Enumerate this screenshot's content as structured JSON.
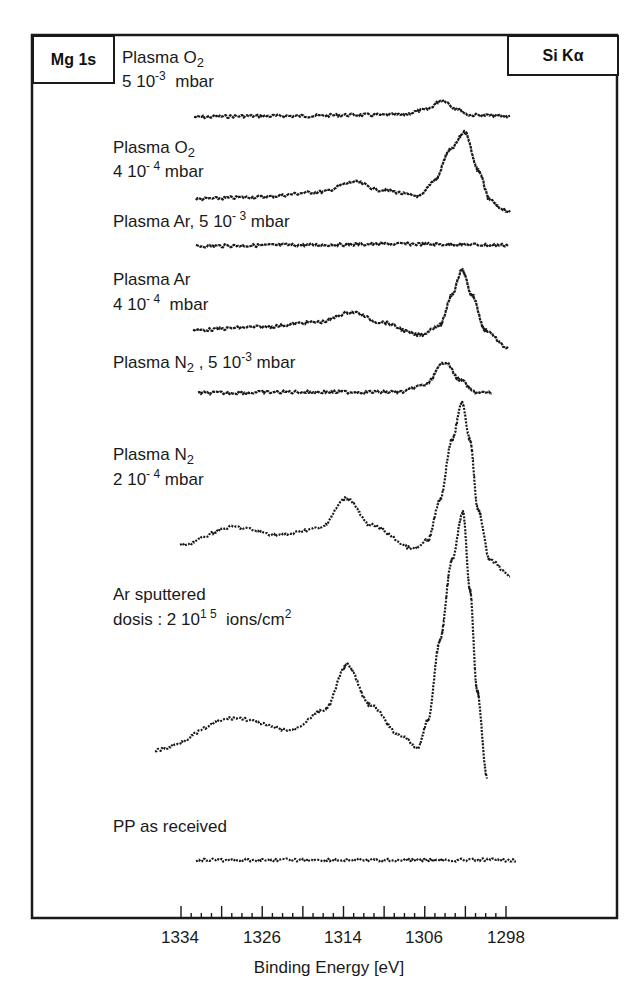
{
  "chart_data": {
    "type": "line",
    "title": "",
    "xlabel": "Binding Energy [eV]",
    "ylabel": "",
    "x_reversed": true,
    "xlim": [
      1334,
      1298
    ],
    "x_ticks": [
      "1334",
      "1326",
      "1314",
      "1306",
      "1298"
    ],
    "grid": false,
    "legend": "none (inline trace labels)",
    "corner_tags": {
      "left": "Mg 1s",
      "right": "Si Kα"
    },
    "series": [
      {
        "name": "Plasma O2, 5 10^-3 mbar",
        "label_lines": [
          "Plasma O",
          "2",
          "5 10",
          "-3",
          "mbar"
        ],
        "description": "nearly flat baseline with weak peak near 1303 eV",
        "points_px": [
          [
            194,
            117
          ],
          [
            250,
            116
          ],
          [
            300,
            116
          ],
          [
            350,
            115
          ],
          [
            400,
            115
          ],
          [
            425,
            110
          ],
          [
            443,
            100
          ],
          [
            455,
            108
          ],
          [
            470,
            115
          ],
          [
            510,
            116
          ]
        ]
      },
      {
        "name": "Plasma O2, 4 10^-4 mbar",
        "description": "small bump near 1314 eV, strong peak near 1302 eV",
        "points_px": [
          [
            196,
            199
          ],
          [
            260,
            197
          ],
          [
            320,
            192
          ],
          [
            355,
            182
          ],
          [
            380,
            190
          ],
          [
            420,
            196
          ],
          [
            435,
            180
          ],
          [
            450,
            150
          ],
          [
            465,
            132
          ],
          [
            478,
            170
          ],
          [
            490,
            200
          ],
          [
            500,
            208
          ],
          [
            510,
            212
          ]
        ]
      },
      {
        "name": "Plasma Ar, 5 10^-3 mbar",
        "description": "flat, no features",
        "points_px": [
          [
            196,
            246
          ],
          [
            300,
            245
          ],
          [
            400,
            244
          ],
          [
            508,
            245
          ]
        ]
      },
      {
        "name": "Plasma Ar, 4 10^-4 mbar",
        "description": "bump near 1314 eV, strong peak near 1302 eV",
        "points_px": [
          [
            193,
            330
          ],
          [
            260,
            327
          ],
          [
            320,
            322
          ],
          [
            352,
            312
          ],
          [
            380,
            322
          ],
          [
            420,
            335
          ],
          [
            440,
            325
          ],
          [
            452,
            295
          ],
          [
            462,
            270
          ],
          [
            472,
            295
          ],
          [
            485,
            330
          ],
          [
            508,
            348
          ]
        ]
      },
      {
        "name": "Plasma N2, 5 10^-3 mbar",
        "description": "flat with a peak near 1303 eV",
        "points_px": [
          [
            198,
            393
          ],
          [
            300,
            392
          ],
          [
            400,
            392
          ],
          [
            425,
            385
          ],
          [
            445,
            362
          ],
          [
            460,
            380
          ],
          [
            475,
            392
          ],
          [
            492,
            393
          ]
        ]
      },
      {
        "name": "Plasma N2, 2 10^-4 mbar",
        "description": "shoulder near 1329 eV, peak near 1314 eV, very strong peak near 1302 eV",
        "points_px": [
          [
            180,
            545
          ],
          [
            233,
            527
          ],
          [
            280,
            535
          ],
          [
            320,
            528
          ],
          [
            347,
            498
          ],
          [
            370,
            525
          ],
          [
            415,
            549
          ],
          [
            428,
            540
          ],
          [
            440,
            500
          ],
          [
            452,
            440
          ],
          [
            462,
            403
          ],
          [
            470,
            440
          ],
          [
            478,
            510
          ],
          [
            490,
            560
          ],
          [
            510,
            576
          ]
        ]
      },
      {
        "name": "Ar sputtered, dosis: 2 10^15 ions/cm2",
        "description": "rising background, peak near 1314 eV, dominant sharp peak near 1302 eV",
        "points_px": [
          [
            155,
            750
          ],
          [
            235,
            718
          ],
          [
            290,
            730
          ],
          [
            325,
            710
          ],
          [
            347,
            665
          ],
          [
            370,
            705
          ],
          [
            400,
            735
          ],
          [
            418,
            748
          ],
          [
            428,
            720
          ],
          [
            440,
            640
          ],
          [
            452,
            560
          ],
          [
            463,
            512
          ],
          [
            470,
            590
          ],
          [
            477,
            690
          ],
          [
            487,
            777
          ]
        ]
      },
      {
        "name": "PP as received",
        "description": "flat, no features",
        "points_px": [
          [
            196,
            860
          ],
          [
            300,
            860
          ],
          [
            400,
            860
          ],
          [
            516,
            860
          ]
        ]
      }
    ]
  },
  "labels": {
    "tag_left": "Mg 1s",
    "tag_right": "Si Kα",
    "s1_a": "Plasma O",
    "s1_a_sub": "2",
    "s1_b": "5 10",
    "s1_b_sup": "-3",
    "s1_b_unit": "mbar",
    "s2_a": "Plasma O",
    "s2_a_sub": "2",
    "s2_b": "4 10",
    "s2_b_sup": "- 4",
    "s2_b_unit": "mbar",
    "s3_a": "Plasma Ar, 5 10",
    "s3_a_sup": "- 3",
    "s3_a_unit": "mbar",
    "s4_a": "Plasma  Ar",
    "s4_b": "4 10",
    "s4_b_sup": "- 4",
    "s4_b_unit": "mbar",
    "s5_a": "Plasma N",
    "s5_a_sub": "2",
    "s5_a_rest": " , 5 10",
    "s5_a_sup": "-3",
    "s5_a_unit": "mbar",
    "s6_a": "Plasma N",
    "s6_a_sub": "2",
    "s6_b": "2 10",
    "s6_b_sup": "- 4",
    "s6_b_unit": "mbar",
    "s7_a": "Ar  sputtered",
    "s7_b": "dosis :  2 10",
    "s7_b_sup": "1 5",
    "s7_b_unit": "ions/cm",
    "s7_b_unit_sup": "2",
    "s8_a": "PP  as  received"
  },
  "axis": {
    "ticks": [
      {
        "label": "1334",
        "x": 180
      },
      {
        "label": "1326",
        "x": 262
      },
      {
        "label": "1314",
        "x": 343
      },
      {
        "label": "1306",
        "x": 424
      },
      {
        "label": "1298",
        "x": 506
      }
    ],
    "title": "Binding Energy [eV]"
  },
  "colors": {
    "ink": "#1a1a1a",
    "background": "#ffffff"
  }
}
